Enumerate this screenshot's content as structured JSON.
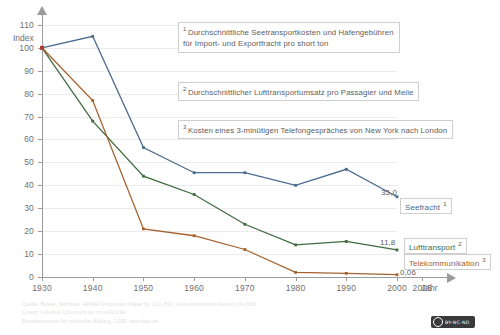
{
  "axes": {
    "y_title": "Index",
    "x_title": "Jahr",
    "y_ticks": [
      "0",
      "10",
      "20",
      "30",
      "40",
      "50",
      "60",
      "70",
      "80",
      "90",
      "100",
      "110"
    ],
    "x_ticks": [
      "1930",
      "1940",
      "1950",
      "1960",
      "1970",
      "1980",
      "1990",
      "2000",
      "2005"
    ]
  },
  "notes": [
    {
      "marker": "1",
      "text": "Durchschnittliche Seetransportkosten und Hafengebühren\nfür Import- und Exportfracht pro short ton"
    },
    {
      "marker": "2",
      "text": "Durchschnittlicher Lufttransportumsatz pro Passagier und Meile"
    },
    {
      "marker": "3",
      "text": "Kosten eines 3-minütigen Telefongespräches von New York nach London"
    }
  ],
  "legend": [
    {
      "label": "Seefracht",
      "marker": "1",
      "color": "#4a6a8e",
      "value_label": "35,0"
    },
    {
      "label": "Lufttransport",
      "marker": "2",
      "color": "#3f6b3f",
      "value_label": "11,8"
    },
    {
      "label": "Telekommunikation",
      "marker": "3",
      "color": "#a5612e",
      "value_label": "0,06"
    }
  ],
  "footer": {
    "line1": "Quelle: Busse, Matthias: HWWA Discussion Paper Nr. 110, BDI: Außenwirtschafts Report 04/2003",
    "line2": "Lizenz: Creative Commons by-nc-nd/3.0/de",
    "line3": "Bundeszentrale für politische Bildung, 2008, www.bpb.de"
  },
  "cc_badge": {
    "text": "BY-NC-ND"
  },
  "chart_data": {
    "type": "line",
    "title": "",
    "xlabel": "Jahr",
    "ylabel": "Index",
    "xlim": [
      1930,
      2008
    ],
    "ylim": [
      0,
      113
    ],
    "grid": true,
    "legend_position": "right-inline",
    "x": [
      1930,
      1940,
      1950,
      1960,
      1970,
      1980,
      1990,
      2000
    ],
    "series": [
      {
        "name": "Seefracht",
        "color": "#4a6a8e",
        "values": [
          100,
          105,
          56.5,
          45.5,
          45.5,
          40,
          47,
          35.0
        ],
        "end_label": "35,0"
      },
      {
        "name": "Lufttransport",
        "color": "#3f6b3f",
        "values": [
          100,
          68,
          44,
          36,
          23,
          14,
          15.5,
          11.8
        ],
        "end_label": "11,8"
      },
      {
        "name": "Telekommunikation",
        "color": "#a5612e",
        "values": [
          100,
          77,
          21,
          18,
          12,
          2,
          1.6,
          1.0
        ],
        "end_label": "0,06"
      }
    ]
  }
}
